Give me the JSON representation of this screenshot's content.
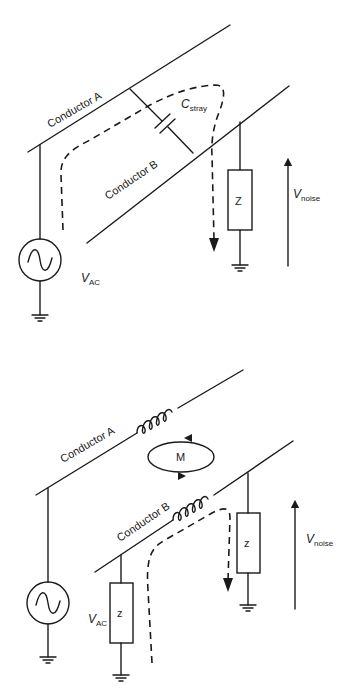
{
  "diagrams": [
    {
      "name": "capacitive-coupling",
      "labels": {
        "conductor_a": "Conductor A",
        "conductor_b": "Conductor B",
        "c_main": "C",
        "c_sub": "stray",
        "z": "Z",
        "vnoise_main": "V",
        "vnoise_sub": "noise",
        "vac_main": "V",
        "vac_sub": "AC"
      }
    },
    {
      "name": "inductive-coupling",
      "labels": {
        "conductor_a": "Conductor A",
        "conductor_b": "Conductor B",
        "m": "M",
        "z1": "z",
        "z2": "z",
        "vnoise_main": "V",
        "vnoise_sub": "noise",
        "vac_main": "V",
        "vac_sub": "AC"
      }
    }
  ],
  "colors": {
    "ink": "#1a1a1a",
    "background": "#ffffff"
  }
}
